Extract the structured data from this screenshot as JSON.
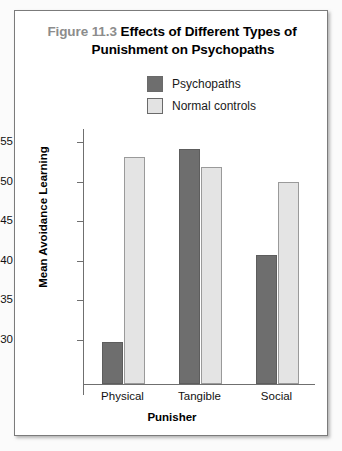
{
  "figure": {
    "number": "Figure 11.3",
    "title_line1": "Effects of Different Types of",
    "title_line2": "Punishment on Psychopaths"
  },
  "colors": {
    "psychopaths": "#6e6e6e",
    "normal_controls": "#e4e4e4",
    "axis": "#6f6f6f",
    "figure_number": "#8c8c8c",
    "frame_border": "#7b7b7b"
  },
  "legend": {
    "position": "top-center",
    "items": [
      {
        "label": "Psychopaths",
        "swatch": "dark"
      },
      {
        "label": "Normal controls",
        "swatch": "light"
      }
    ]
  },
  "axes": {
    "y_ticks": [
      "0.55",
      "0.50",
      "0.45",
      "0.40",
      "0.35",
      "0.30"
    ],
    "x_categories": [
      "Physical",
      "Tangible",
      "Social"
    ],
    "ylabel": "Mean Avoidance Learning",
    "xlabel": "Punisher"
  },
  "chart_data": {
    "type": "bar",
    "title": "Figure 11.3 Effects of Different Types of Punishment on Psychopaths",
    "categories": [
      "Physical",
      "Tangible",
      "Social"
    ],
    "series": [
      {
        "name": "Psychopaths",
        "values": [
          0.297,
          0.542,
          0.408
        ],
        "color": "#6e6e6e"
      },
      {
        "name": "Normal controls",
        "values": [
          0.532,
          0.519,
          0.5
        ],
        "color": "#e4e4e4"
      }
    ],
    "xlabel": "Punisher",
    "ylabel": "Mean Avoidance Learning",
    "ylim": [
      0.244,
      0.567
    ],
    "ytick_values": [
      0.3,
      0.35,
      0.4,
      0.45,
      0.5,
      0.55
    ],
    "ytick_labels": [
      "0.30",
      "0.35",
      "0.40",
      "0.45",
      "0.50",
      "0.55"
    ],
    "grid": false,
    "legend_position": "top-center"
  }
}
